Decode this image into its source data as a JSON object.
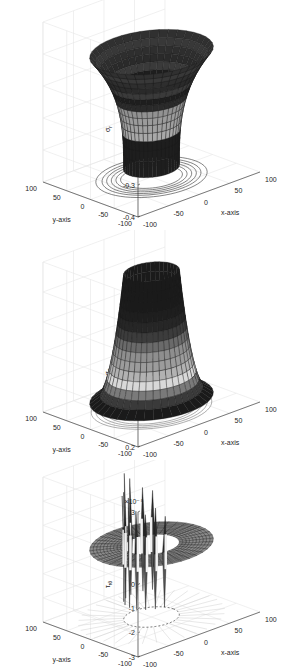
{
  "chart_data": [
    {
      "type": "surface3d",
      "title": "",
      "xlabel": "x-axis",
      "ylabel": "y-axis",
      "zlabel": "σ_r",
      "xticks": [
        -100,
        -50,
        0,
        50,
        100
      ],
      "yticks": [
        -100,
        -50,
        0,
        50,
        100
      ],
      "zticks": [
        -0.4,
        -0.3,
        -0.2,
        -0.1,
        0,
        0.1
      ],
      "zlim": [
        -0.4,
        0.1
      ],
      "grid": true,
      "shape": "funnel (narrow bottom r≈35 at z≈-0.35, flaring to r≈80 at z≈0)",
      "contours_on_floor": true
    },
    {
      "type": "surface3d",
      "title": "",
      "xlabel": "x-axis",
      "ylabel": "y-axis",
      "zlabel": "σ_θ",
      "xticks": [
        -100,
        -50,
        0,
        50,
        100
      ],
      "yticks": [
        -100,
        -50,
        0,
        50,
        100
      ],
      "zticks": [
        0.2,
        0.3,
        0.4,
        0.5,
        0.6,
        0.7
      ],
      "zlim": [
        0.2,
        0.7
      ],
      "grid": true,
      "shape": "bell (r≈35 at z≈0.65, widening to r≈80 at z≈0.25)",
      "contours_on_floor": true
    },
    {
      "type": "surface3d",
      "title": "",
      "xlabel": "x-axis",
      "ylabel": "y-axis",
      "zlabel": "τ_rθ",
      "zscale_label": "×10⁻⁸",
      "xticks": [
        -100,
        -50,
        0,
        50,
        100
      ],
      "yticks": [
        -100,
        -50,
        0,
        50,
        100
      ],
      "zticks": [
        -3,
        -2,
        -1,
        0,
        1,
        2,
        3
      ],
      "zlim": [
        -3,
        3
      ],
      "grid": true,
      "shape": "flat annulus at z≈0 (r 35–80) with numerical spikes near inner radius reaching ±3e-8",
      "contours_on_floor": true
    }
  ],
  "plots": [
    {
      "zlabel": "σ",
      "zsub": "r",
      "zticks": [
        "0.1",
        "0",
        "-0.1",
        "-0.2",
        "-0.3",
        "-0.4"
      ],
      "exponent": ""
    },
    {
      "zlabel": "σ",
      "zsub": "θ",
      "zticks": [
        "0.7",
        "0.6",
        "0.5",
        "0.4",
        "0.3",
        "0.2"
      ],
      "exponent": ""
    },
    {
      "zlabel": "τ",
      "zsub": "rθ",
      "zticks": [
        "3",
        "2",
        "1",
        "0",
        "-1",
        "-2",
        "-3"
      ],
      "exponent": "×10⁻⁸"
    }
  ],
  "axes": {
    "xlabel": "x-axis",
    "ylabel": "y-axis",
    "xticks": [
      "-100",
      "-50",
      "0",
      "50",
      "100"
    ],
    "yticks": [
      "100",
      "50",
      "0",
      "-50",
      "-100"
    ]
  }
}
